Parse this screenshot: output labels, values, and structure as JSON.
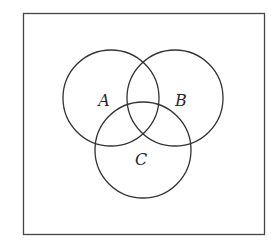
{
  "diagram": {
    "type": "venn",
    "universe": {
      "x": 23,
      "y": 13,
      "width": 241,
      "height": 221,
      "stroke": "#444444"
    },
    "sets": [
      {
        "label": "A",
        "cx": 111,
        "cy": 98,
        "r": 48,
        "label_x": 104,
        "label_y": 106
      },
      {
        "label": "B",
        "cx": 175,
        "cy": 98,
        "r": 48,
        "label_x": 181,
        "label_y": 106
      },
      {
        "label": "C",
        "cx": 143,
        "cy": 150,
        "r": 48,
        "label_x": 141,
        "label_y": 165
      }
    ],
    "stroke_color": "#333333"
  }
}
